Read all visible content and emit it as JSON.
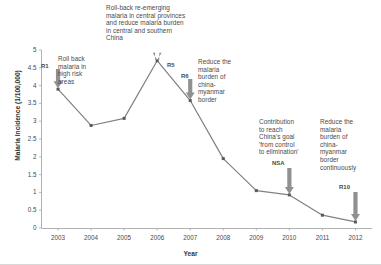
{
  "chart_data": {
    "type": "line",
    "title": "",
    "xlabel": "Year",
    "ylabel": "Malaria Incidence (1/100,000)",
    "categories": [
      2003,
      2004,
      2005,
      2006,
      2007,
      2008,
      2009,
      2010,
      2011,
      2012
    ],
    "values": [
      3.9,
      2.88,
      3.08,
      4.7,
      3.58,
      1.95,
      1.05,
      0.93,
      0.36,
      0.17
    ],
    "xlim": [
      2002.5,
      2012.5
    ],
    "ylim": [
      0,
      5
    ],
    "ytick_labels": [
      "0",
      "0.5",
      "1",
      "1.5",
      "2",
      "2.5",
      "3",
      "3.5",
      "4",
      "4.5",
      "5"
    ],
    "ytick_values": [
      0,
      0.5,
      1,
      1.5,
      2,
      2.5,
      3,
      3.5,
      4,
      4.5,
      5
    ],
    "xtick_labels": [
      "2003",
      "2004",
      "2005",
      "2006",
      "2007",
      "2008",
      "2009",
      "2010",
      "2011",
      "2012"
    ],
    "grid": false,
    "legend": false,
    "series_color": "#808080",
    "marker_color": "#595959",
    "annotations": [
      {
        "id": "R1",
        "code": "R1",
        "text": "Roll back\nmalaria in\nhigh risk\nareas",
        "target_year": 2003,
        "target_value": 3.9
      },
      {
        "id": "R5",
        "code": "R5",
        "text": "Roll-back re-emerging\nmalaria in central provinces\nand reduce malaria burden\nin central and southern\nChina",
        "target_year": 2006,
        "target_value": 4.7
      },
      {
        "id": "R6",
        "code": "R6",
        "text": "Reduce the\nmalaria\nburden of\nchina-\nmyanmar\nborder",
        "target_year": 2007,
        "target_value": 3.58
      },
      {
        "id": "NSA",
        "code": "NSA",
        "text": "Contribution\nto reach\nChina's goal\n'from control\nto elimination'",
        "target_year": 2010,
        "target_value": 0.93
      },
      {
        "id": "R10",
        "code": "R10",
        "text": "Reduce the\nmalaria\nburden of\nchina-\nmyanmar\nborder\ncontinuously",
        "target_year": 2012,
        "target_value": 0.17
      }
    ]
  },
  "axes": {
    "y_title": "Malaria Incidence (1/100,000)",
    "x_title": "Year"
  },
  "colors": {
    "line": "#808080",
    "marker": "#595959",
    "arrow": "#909090",
    "axis": "#999999",
    "text": "#4a4a4a"
  }
}
